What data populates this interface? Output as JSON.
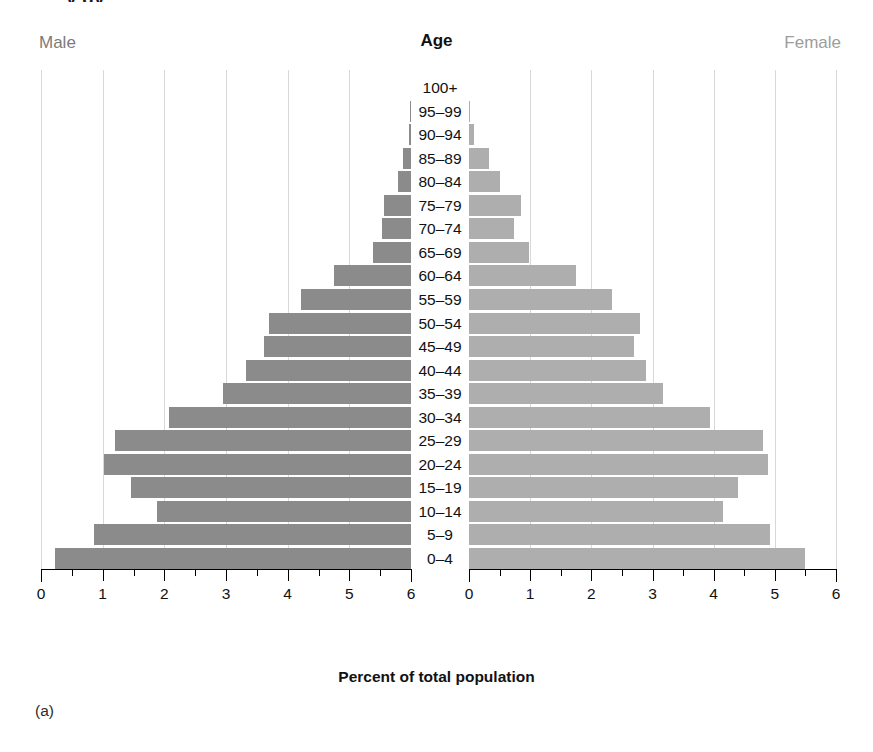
{
  "figure": {
    "caption": "(a)",
    "clipped_top_text": "y gy",
    "male_header": "Male",
    "female_header": "Female",
    "age_header": "Age",
    "axis_title": "Percent of total population",
    "male_color": "#8b8b8b",
    "female_color": "#aeaeae",
    "gridline_color": "#d8d8d8"
  },
  "chart_data": {
    "type": "bar",
    "title": "Age",
    "subtitle": "",
    "xlabel": "Percent of total population",
    "ylabel": "Age",
    "orientation": "horizontal",
    "layout": "population-pyramid",
    "grid": true,
    "legend_position": "top-outside",
    "xlim_left": [
      6,
      0
    ],
    "xlim_right": [
      0,
      6
    ],
    "xticks": [
      0,
      1,
      2,
      3,
      4,
      5,
      6
    ],
    "xticklabels_left": [
      "6",
      "5",
      "4",
      "3",
      "2",
      "1",
      "0"
    ],
    "xticklabels_right": [
      "0",
      "1",
      "2",
      "3",
      "4",
      "5",
      "6"
    ],
    "minor_ticks": true,
    "categories": [
      "100+",
      "95–99",
      "90–94",
      "85–89",
      "80–84",
      "75–79",
      "70–74",
      "65–69",
      "60–64",
      "55–59",
      "50–54",
      "45–49",
      "40–44",
      "35–39",
      "30–34",
      "25–29",
      "20–24",
      "15–19",
      "10–14",
      "5–9",
      "0–4"
    ],
    "series": [
      {
        "name": "Male",
        "side": "left",
        "color": "#8b8b8b",
        "values": [
          0.0,
          0.01,
          0.04,
          0.13,
          0.21,
          0.44,
          0.47,
          0.62,
          1.25,
          1.78,
          2.3,
          2.38,
          2.67,
          3.05,
          3.92,
          4.8,
          4.98,
          4.54,
          4.12,
          5.14,
          5.77
        ]
      },
      {
        "name": "Female",
        "side": "right",
        "color": "#aeaeae",
        "values": [
          0.0,
          0.02,
          0.08,
          0.33,
          0.51,
          0.85,
          0.74,
          0.98,
          1.75,
          2.34,
          2.79,
          2.69,
          2.89,
          3.17,
          3.94,
          4.8,
          4.89,
          4.39,
          4.15,
          4.92,
          5.49
        ]
      }
    ]
  }
}
